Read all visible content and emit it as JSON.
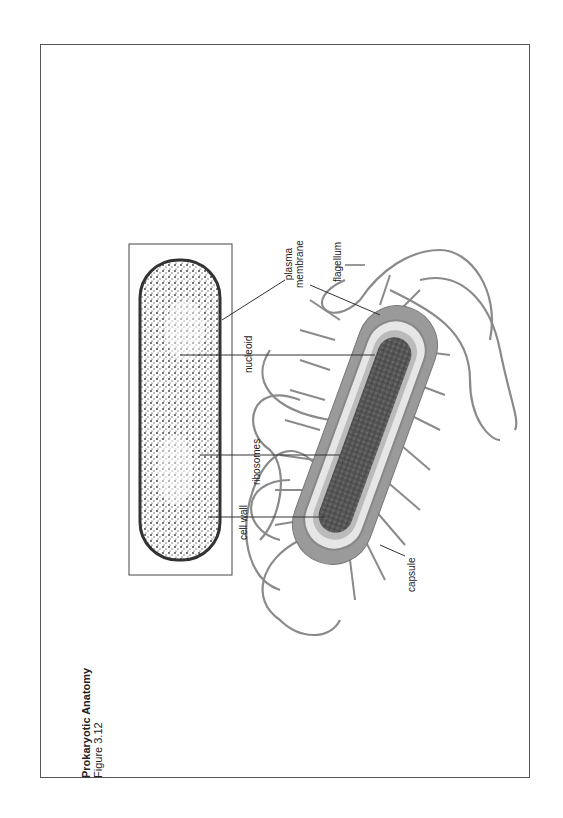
{
  "figure": {
    "title": "Prokaryotic Anatomy",
    "subtitle": "Figure 3.12"
  },
  "labels": {
    "cell_wall": "cell wall",
    "ribosomes": "ribosomes",
    "nucleoid": "nucleoid",
    "plasma_line1": "plasma",
    "plasma_line2": "membrane",
    "flagellum": "flagellum",
    "capsule": "capsule"
  },
  "colors": {
    "frame": "#555555",
    "capsule": "#9a9a9a",
    "wall": "#e8e8e8",
    "cytoplasm": "#4a4a4a",
    "flagella": "#888888"
  }
}
